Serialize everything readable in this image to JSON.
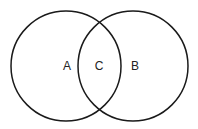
{
  "diagram": {
    "type": "venn",
    "stroke_color": "#1a1a1a",
    "sets": [
      {
        "id": "left",
        "label": "A",
        "cx": 66,
        "cy": 66,
        "r": 55
      },
      {
        "id": "right",
        "label": "B",
        "cx": 133,
        "cy": 66,
        "r": 55
      }
    ],
    "intersection_label": "C",
    "labels": {
      "a": "A",
      "b": "B",
      "c": "C"
    }
  }
}
